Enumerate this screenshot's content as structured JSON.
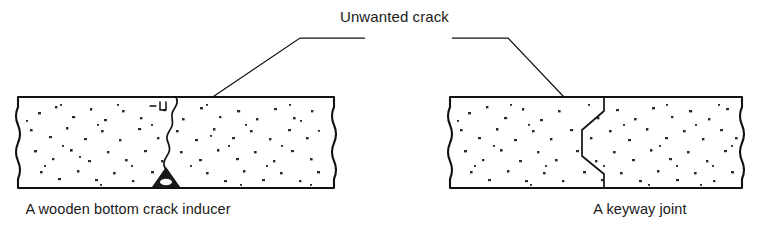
{
  "figure": {
    "type": "technical-diagram",
    "callout": {
      "label": "Unwanted crack",
      "label_x": 340,
      "label_y": 22,
      "leaders": [
        {
          "name": "leader-left",
          "target": "wooden-bottom-crack-inducer-crack",
          "points": "365,38 300,38 185,116",
          "arrow_at": [
            185,
            116
          ],
          "arrow_angle": 146
        },
        {
          "name": "leader-right",
          "target": "keyway-joint-crack",
          "points": "452,38 508,38 583,117",
          "arrow_at": [
            583,
            117
          ],
          "arrow_angle": 46
        }
      ]
    },
    "panels": [
      {
        "id": "wooden-bottom-crack-inducer",
        "caption": "A wooden bottom crack inducer",
        "caption_x": 128,
        "caption_y": 214,
        "slab": {
          "x": 18,
          "y": 97,
          "width": 316,
          "height": 91
        },
        "crack_description": "Irregular vertical crack running full slab depth from top surface down to the wooden inducer",
        "inducer_description": "Triangular wooden crack inducer fixed to the bottom of the slab"
      },
      {
        "id": "keyway-joint",
        "caption": "A keyway joint",
        "caption_x": 640,
        "caption_y": 214,
        "slab": {
          "x": 450,
          "y": 97,
          "width": 292,
          "height": 91
        },
        "crack_description": "Stepped keyway (tongue-and-groove) joint profile through the full slab depth",
        "inducer_description": "None"
      }
    ],
    "colors": {
      "ink": "#111111",
      "paper": "#ffffff",
      "aggregate": "#2b2b2b"
    }
  }
}
